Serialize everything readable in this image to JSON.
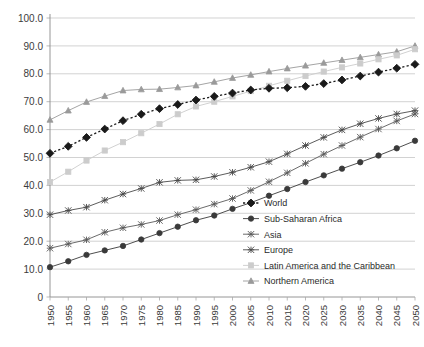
{
  "chart_data": {
    "type": "line",
    "title": "",
    "xlabel": "",
    "ylabel": "",
    "ylim": [
      0,
      100
    ],
    "grid": true,
    "legend_position": "inside-bottom-right",
    "x": [
      1950,
      1955,
      1960,
      1965,
      1970,
      1975,
      1980,
      1985,
      1990,
      1995,
      2000,
      2005,
      2010,
      2015,
      2020,
      2025,
      2030,
      2035,
      2040,
      2045,
      2050
    ],
    "ytick_labels": [
      "0",
      "10.0",
      "20.0",
      "30.0",
      "40.0",
      "50.0",
      "60.0",
      "70.0",
      "80.0",
      "90.0",
      "100.0"
    ],
    "ytick_values": [
      0,
      10,
      20,
      30,
      40,
      50,
      60,
      70,
      80,
      90,
      100
    ],
    "xtick_labels": [
      "1950",
      "1955",
      "1960",
      "1965",
      "1970",
      "1975",
      "1980",
      "1985",
      "1990",
      "1995",
      "2000",
      "2005",
      "2010",
      "2015",
      "2020",
      "2025",
      "2030",
      "2035",
      "2040",
      "2045",
      "2050"
    ],
    "series": [
      {
        "name": "World",
        "marker": "diamond",
        "line_style": "dotted",
        "color": "#1a1a1a",
        "values": [
          51.5,
          54.0,
          57.2,
          60.2,
          63.2,
          65.5,
          67.5,
          69.0,
          70.6,
          71.9,
          73.1,
          74.2,
          74.8,
          75.0,
          75.5,
          76.5,
          77.8,
          79.2,
          80.6,
          82.0,
          83.4
        ]
      },
      {
        "name": "Sub-Saharan Africa",
        "marker": "circle",
        "line_style": "solid",
        "color": "#3a3a3a",
        "values": [
          10.7,
          12.8,
          15.1,
          16.7,
          18.3,
          20.6,
          22.9,
          25.2,
          27.5,
          29.2,
          31.6,
          33.8,
          36.3,
          38.7,
          41.2,
          43.6,
          46.0,
          48.3,
          50.7,
          53.3,
          56.0
        ]
      },
      {
        "name": "Asia",
        "marker": "star",
        "line_style": "solid",
        "color": "#5a5a5a",
        "values": [
          17.5,
          19.0,
          20.5,
          23.2,
          24.8,
          26.0,
          27.4,
          29.5,
          31.3,
          33.3,
          35.3,
          38.2,
          41.3,
          44.5,
          47.9,
          51.2,
          54.3,
          57.3,
          60.2,
          63.1,
          65.6
        ]
      },
      {
        "name": "Europe",
        "marker": "plus",
        "line_style": "solid",
        "color": "#4a4a4a",
        "values": [
          29.5,
          31.0,
          32.2,
          34.7,
          36.9,
          38.9,
          41.1,
          41.8,
          42.0,
          43.2,
          44.7,
          46.5,
          48.5,
          51.3,
          54.3,
          57.2,
          59.9,
          62.1,
          64.0,
          65.6,
          66.8
        ]
      },
      {
        "name": "Latin America and the Caribbean",
        "marker": "square",
        "line_style": "solid",
        "color": "#cccccc",
        "values": [
          41.2,
          44.9,
          48.9,
          52.5,
          55.5,
          58.7,
          62.0,
          65.5,
          68.3,
          70.0,
          71.9,
          73.8,
          75.7,
          77.5,
          79.2,
          80.8,
          82.3,
          83.7,
          85.2,
          86.6,
          88.8
        ]
      },
      {
        "name": "Northern America",
        "marker": "triangle",
        "line_style": "solid",
        "color": "#9a9a9a",
        "values": [
          63.5,
          66.8,
          69.9,
          72.0,
          74.0,
          74.4,
          74.5,
          75.1,
          75.8,
          77.1,
          78.5,
          79.6,
          80.8,
          81.9,
          82.9,
          83.9,
          84.9,
          85.9,
          86.9,
          87.9,
          90.0
        ]
      }
    ]
  }
}
